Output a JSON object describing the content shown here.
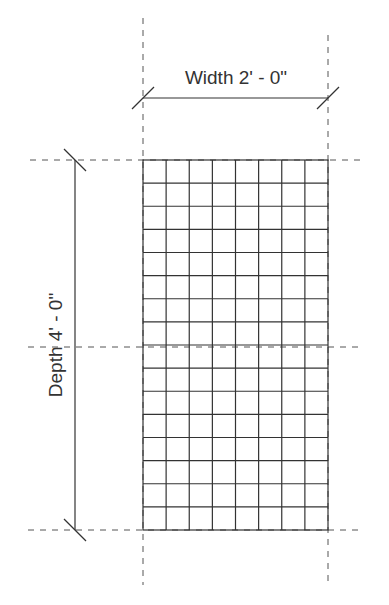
{
  "diagram": {
    "type": "dimensioned-grid-plan",
    "width_label": "Width 2' - 0\"",
    "depth_label": "Depth 4' - 0\"",
    "grid": {
      "columns": 8,
      "rows": 16,
      "midline": true
    },
    "colors": {
      "line": "#333333",
      "dashed": "#555555",
      "background": "#ffffff"
    }
  }
}
